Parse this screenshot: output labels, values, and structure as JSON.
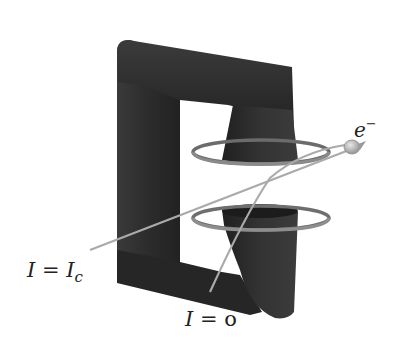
{
  "diagram": {
    "labels": {
      "electron": "e",
      "electron_superscript": "−",
      "critical_current_lhs": "I",
      "critical_current_eq": " = ",
      "critical_current_rhs": "I",
      "critical_current_sub": "c",
      "zero_current_lhs": "I",
      "zero_current_eq": " = ",
      "zero_current_rhs": "o"
    },
    "colors": {
      "core": "#2e2e2e",
      "core_highlight": "#4a4a4a",
      "core_shadow": "#1a1a1a",
      "loop": "#6b6b6b",
      "loop_highlight": "#a8a8a8",
      "trajectory": "#a9a9a9",
      "electron": "#b5b5b5",
      "background": "#ffffff"
    }
  }
}
